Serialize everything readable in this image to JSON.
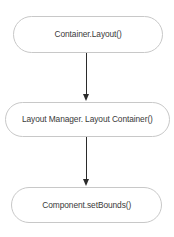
{
  "diagram": {
    "type": "flowchart",
    "orientation": "vertical",
    "background_color": "#ffffff",
    "node_border_color": "#c8c8c8",
    "node_fill_color": "#ffffff",
    "text_color": "#3a3a3a",
    "arrow_color": "#2b2b2b",
    "nodes": [
      {
        "id": "node-0",
        "label": "Container.Layout()",
        "shape": "rounded-rectangle"
      },
      {
        "id": "node-1",
        "label": "Layout Manager. Layout Container()",
        "shape": "rounded-rectangle"
      },
      {
        "id": "node-2",
        "label": "Component.setBounds()",
        "shape": "rounded-rectangle"
      }
    ],
    "edges": [
      {
        "id": "edge-0",
        "from": "node-0",
        "to": "node-1",
        "label": "",
        "style": "solid-arrow"
      },
      {
        "id": "edge-1",
        "from": "node-1",
        "to": "node-2",
        "label": "",
        "style": "solid-arrow"
      }
    ]
  }
}
